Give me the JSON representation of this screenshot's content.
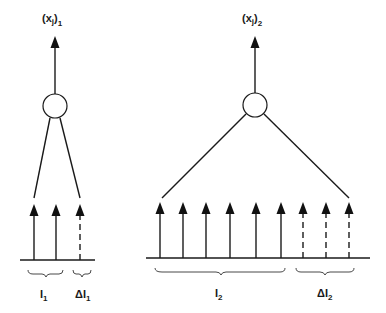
{
  "diagram": {
    "units": [
      {
        "output_label": {
          "base": "(x",
          "sub1": "j",
          "close": ")",
          "sub2": "1"
        },
        "inputs_solid": 2,
        "inputs_dashed": 1,
        "group_labels": [
          {
            "prefix": "",
            "base": "I",
            "sub": "1"
          },
          {
            "prefix": "Δ",
            "base": "I",
            "sub": "1"
          }
        ]
      },
      {
        "output_label": {
          "base": "(x",
          "sub1": "j",
          "close": ")",
          "sub2": "2"
        },
        "inputs_solid": 6,
        "inputs_dashed": 3,
        "group_labels": [
          {
            "prefix": "",
            "base": "I",
            "sub": "2"
          },
          {
            "prefix": "Δ",
            "base": "I",
            "sub": "2"
          }
        ]
      }
    ]
  }
}
